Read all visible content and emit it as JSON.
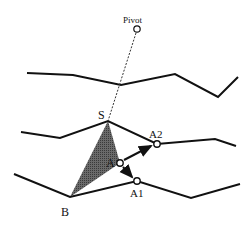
{
  "diagram": {
    "labels": {
      "pivot": "Pivot",
      "s": "S",
      "a": "A",
      "a1": "A1",
      "a2": "A2",
      "b": "B"
    },
    "colors": {
      "line": "#111111",
      "shade": "#555555",
      "background": "#ffffff"
    },
    "points": {
      "pivot": [
        137,
        29
      ],
      "s": [
        108,
        121
      ],
      "a": [
        120,
        163
      ],
      "a1": [
        137,
        181
      ],
      "a2": [
        157,
        144
      ],
      "b": [
        70,
        197
      ]
    }
  }
}
